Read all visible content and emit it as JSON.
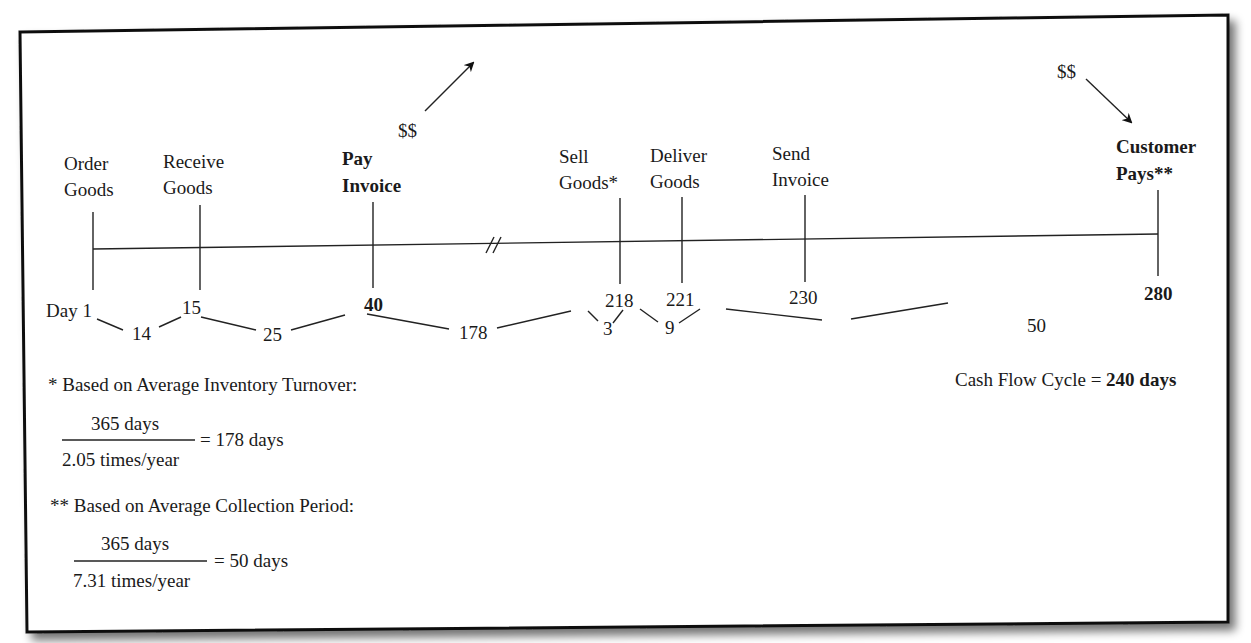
{
  "diagram": {
    "type": "timeline",
    "events": [
      {
        "id": "order",
        "line1": "Order",
        "line2": "Goods",
        "day": "Day 1",
        "bold": false,
        "x": 93
      },
      {
        "id": "receive",
        "line1": "Receive",
        "line2": "Goods",
        "day": "15",
        "bold": false,
        "x": 200
      },
      {
        "id": "pay",
        "line1": "Pay",
        "line2": "Invoice",
        "day": "40",
        "bold": true,
        "x": 373
      },
      {
        "id": "sell",
        "line1": "Sell",
        "line2": "Goods*",
        "day": "218",
        "bold": false,
        "x": 620
      },
      {
        "id": "deliver",
        "line1": "Deliver",
        "line2": "Goods",
        "day": "221",
        "bold": false,
        "x": 682
      },
      {
        "id": "send",
        "line1": "Send",
        "line2": "Invoice",
        "day": "230",
        "bold": false,
        "x": 805
      },
      {
        "id": "customer",
        "line1": "Customer",
        "line2": "Pays**",
        "bold": true,
        "day": "280",
        "x": 1158
      }
    ],
    "intervals": [
      "14",
      "25",
      "178",
      "3",
      "9",
      "50"
    ],
    "break_symbol": "//",
    "cash_out_label": "$$",
    "cash_in_label": "$$",
    "summary": {
      "prefix": "Cash Flow Cycle = ",
      "value": "240 days"
    },
    "footnotes": [
      {
        "title": "* Based on Average Inventory Turnover:",
        "numerator": "365 days",
        "denominator": "2.05 times/year",
        "result": "= 178 days"
      },
      {
        "title": "** Based on Average Collection Period:",
        "numerator": "365 days",
        "denominator": "7.31 times/year",
        "result": "= 50 days"
      }
    ]
  }
}
